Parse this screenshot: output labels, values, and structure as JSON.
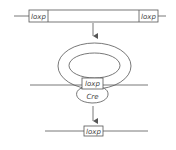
{
  "diagram": {
    "colors": {
      "stroke": "#555555",
      "background": "#ffffff",
      "text": "#444444"
    },
    "step1": {
      "left_site": "loxp",
      "right_site": "loxp"
    },
    "step2": {
      "site": "loxp",
      "enzyme": "Cre"
    },
    "step3": {
      "site": "loxp"
    }
  }
}
